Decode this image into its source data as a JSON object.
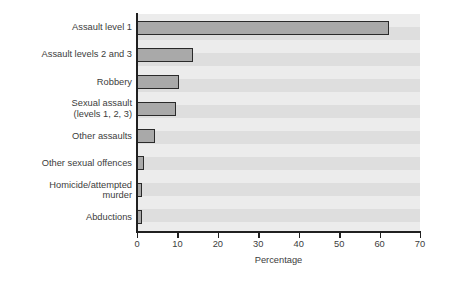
{
  "chart_data": {
    "type": "bar",
    "orientation": "horizontal",
    "title": "",
    "xlabel": "Percentage",
    "ylabel": "",
    "xlim": [
      0,
      70
    ],
    "xticks": [
      0,
      10,
      20,
      30,
      40,
      50,
      60,
      70
    ],
    "xtick_labels": [
      "0",
      "10",
      "20",
      "30",
      "40",
      "50",
      "60",
      "70"
    ],
    "grid": false,
    "legend": null,
    "bands": true,
    "categories": [
      "Assault level 1",
      "Assault levels 2 and  3",
      "Robbery",
      "Sexual assault\n(levels 1, 2, 3)",
      "Other assaults",
      "Other sexual offences",
      "Homicide/attempted\nmurder",
      "Abductions"
    ],
    "values": [
      62.4,
      13.8,
      10.3,
      9.6,
      4.5,
      1.7,
      1.2,
      1.2
    ],
    "bar_fill_color": "#a9a9a9",
    "bar_edge_color": "#2a2a2a",
    "band_color_light": "#ececec",
    "band_color_dark": "#dedede",
    "axis_color": "#202020"
  }
}
